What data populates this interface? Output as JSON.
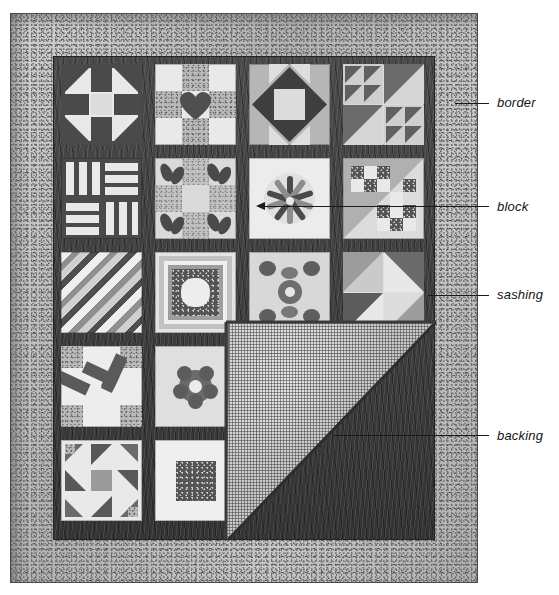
{
  "figure": {
    "alt": "Quilt with 4 by 5 grid of pieced blocks, dark sashing, speckled outer border, and a folded-back corner revealing the gridded backing fabric"
  },
  "annotations": [
    {
      "id": "border",
      "label": "border",
      "target": "outer speckled fabric band framing the quilt top",
      "label_x": 497,
      "label_y": 95,
      "line_x1": 455,
      "line_y1": 103,
      "line_x2": 489,
      "line_y2": 103,
      "tick_x": 455,
      "tick_y": 103,
      "arrow": "none"
    },
    {
      "id": "block",
      "label": "block",
      "target": "dresden-fan pieced square in row 2, column 3",
      "label_x": 497,
      "label_y": 199,
      "line_x1": 263,
      "line_y1": 206,
      "line_x2": 489,
      "line_y2": 206,
      "tick_x": 263,
      "tick_y": 206,
      "arrow": "left"
    },
    {
      "id": "sashing",
      "label": "sashing",
      "target": "dark strip separating the blocks",
      "label_x": 497,
      "label_y": 287,
      "line_x1": 428,
      "line_y1": 295,
      "line_x2": 489,
      "line_y2": 295,
      "tick_x": 428,
      "tick_y": 295,
      "arrow": "none"
    },
    {
      "id": "backing",
      "label": "backing",
      "target": "gridded fabric on the folded-back corner",
      "label_x": 497,
      "label_y": 428,
      "line_x1": 334,
      "line_y1": 435,
      "line_x2": 489,
      "line_y2": 435,
      "tick_x": 334,
      "tick_y": 435,
      "arrow": "none"
    }
  ],
  "quilt": {
    "grid_columns": 4,
    "grid_rows": 5,
    "border_color": "#bdbdbd",
    "sashing_color": "#3a3a3a",
    "backing_color": "#c9c9c9",
    "block_count": 18,
    "blocks": [
      {
        "row": 1,
        "col": 1,
        "name": "churn-dash"
      },
      {
        "row": 1,
        "col": 2,
        "name": "heart-nine-patch"
      },
      {
        "row": 1,
        "col": 3,
        "name": "square-in-a-square-star"
      },
      {
        "row": 1,
        "col": 4,
        "name": "half-square-triangle-sampler"
      },
      {
        "row": 2,
        "col": 1,
        "name": "rail-fence"
      },
      {
        "row": 2,
        "col": 2,
        "name": "bowtie-petal-applique"
      },
      {
        "row": 2,
        "col": 3,
        "name": "dresden-fan"
      },
      {
        "row": 2,
        "col": 4,
        "name": "checkerboard-diagonal"
      },
      {
        "row": 3,
        "col": 1,
        "name": "diagonal-stripes"
      },
      {
        "row": 3,
        "col": 2,
        "name": "framed-medallion"
      },
      {
        "row": 3,
        "col": 3,
        "name": "floral-wreath-applique"
      },
      {
        "row": 3,
        "col": 4,
        "name": "broken-dishes"
      },
      {
        "row": 4,
        "col": 1,
        "name": "pinwheel-star"
      },
      {
        "row": 4,
        "col": 2,
        "name": "rose-applique"
      },
      {
        "row": 5,
        "col": 1,
        "name": "ohio-star-pinwheel"
      },
      {
        "row": 5,
        "col": 2,
        "name": "framed-center-square"
      }
    ]
  }
}
